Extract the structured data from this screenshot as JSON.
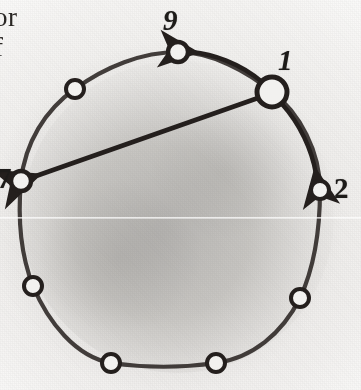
{
  "figure": {
    "type": "ring-graph-diagram",
    "medium": "scanned-book-page",
    "bleed_text_line1": "or",
    "bleed_text_line2": "f",
    "ink_color": "#241f1d",
    "paper_color": "#efeeec",
    "shading_color": "#8a8885",
    "ring": {
      "center_x": 178,
      "center_y": 217,
      "radius": 158,
      "stroke_width": 4
    },
    "nodes": [
      {
        "id": "n1",
        "label": "1",
        "labeled": true,
        "cx": 272,
        "cy": 92,
        "r": 15,
        "stroke": 5
      },
      {
        "id": "n2",
        "label": "2",
        "labeled": true,
        "cx": 320,
        "cy": 190,
        "r": 9,
        "stroke": 4
      },
      {
        "id": "n3",
        "label": "",
        "labeled": false,
        "cx": 300,
        "cy": 298,
        "r": 9,
        "stroke": 4
      },
      {
        "id": "n4",
        "label": "",
        "labeled": false,
        "cx": 216,
        "cy": 363,
        "r": 9,
        "stroke": 4
      },
      {
        "id": "n5",
        "label": "",
        "labeled": false,
        "cx": 111,
        "cy": 363,
        "r": 9,
        "stroke": 4
      },
      {
        "id": "n6",
        "label": "",
        "labeled": false,
        "cx": 33,
        "cy": 286,
        "r": 9,
        "stroke": 4
      },
      {
        "id": "n7",
        "label": "7",
        "labeled": true,
        "cx": 21,
        "cy": 181,
        "r": 10,
        "stroke": 4
      },
      {
        "id": "n8",
        "label": "",
        "labeled": false,
        "cx": 75,
        "cy": 89,
        "r": 9,
        "stroke": 4
      },
      {
        "id": "n9",
        "label": "9",
        "labeled": true,
        "cx": 178,
        "cy": 52,
        "r": 10,
        "stroke": 4
      }
    ],
    "arrows": [
      {
        "id": "arrow-1-to-9",
        "from": "1",
        "to": "9",
        "shape": "curved-arc",
        "direction": "counterclockwise"
      },
      {
        "id": "arrow-1-to-2",
        "from": "1",
        "to": "2",
        "shape": "curved-arc",
        "direction": "clockwise"
      },
      {
        "id": "arrow-1-to-7",
        "from": "1",
        "to": "7",
        "shape": "straight-chord",
        "direction": "across"
      }
    ],
    "labels": {
      "node_1": "1",
      "node_2": "2",
      "node_7": "7",
      "node_9": "9"
    }
  }
}
